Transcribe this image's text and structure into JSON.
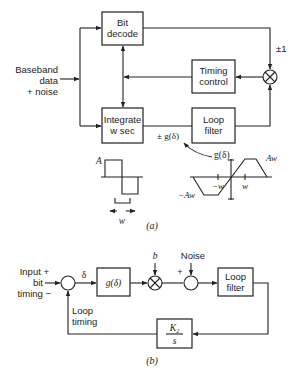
{
  "part_a": {
    "caption": "(a)",
    "input_label": [
      "Baseband",
      "data",
      "+ noise"
    ],
    "blocks": {
      "bit_decode": [
        "Bit",
        "decode"
      ],
      "timing_control": [
        "Timing",
        "control"
      ],
      "integrate": [
        "Integrate",
        "w sec"
      ],
      "loop_filter": [
        "Loop",
        "filter"
      ]
    },
    "sign_label": "±1",
    "error_label": "± g(δ)",
    "pulse": {
      "amplitude_label": "A",
      "width_label": "w"
    },
    "g_curve": {
      "title": "g(δ)",
      "pos_peak": "Aw",
      "neg_peak": "−Aw",
      "neg_tick": "−w",
      "pos_tick": "w"
    }
  },
  "part_b": {
    "caption": "(b)",
    "input_label": [
      "Input +",
      "bit",
      "timing −"
    ],
    "delta_label": "δ",
    "g_block": "g(δ)",
    "b_label": "b",
    "noise_label": "Noise",
    "plus_label": "+",
    "loop_filter": [
      "Loop",
      "filter"
    ],
    "integrator": {
      "numerator": "K₂",
      "denominator": "s"
    },
    "feedback_label": [
      "Loop",
      "timing"
    ]
  }
}
